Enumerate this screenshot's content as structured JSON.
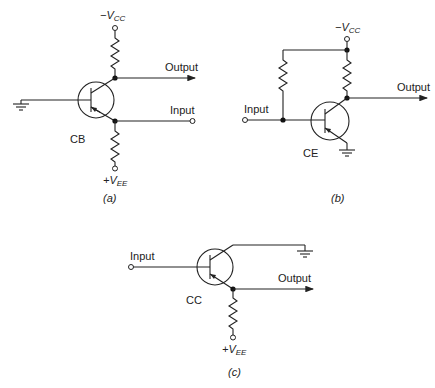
{
  "figure": {
    "panels": [
      {
        "id": "a",
        "caption": "(a)",
        "config_label": "CB",
        "top_supply": {
          "sign": "−",
          "symbol": "V",
          "subscript": "CC"
        },
        "bottom_supply": {
          "sign": "+",
          "symbol": "V",
          "subscript": "EE"
        },
        "output_label": "Output",
        "input_label": "Input"
      },
      {
        "id": "b",
        "caption": "(b)",
        "config_label": "CE",
        "top_supply": {
          "sign": "−",
          "symbol": "V",
          "subscript": "CC"
        },
        "output_label": "Output",
        "input_label": "Input"
      },
      {
        "id": "c",
        "caption": "(c)",
        "config_label": "CC",
        "bottom_supply": {
          "sign": "+",
          "symbol": "V",
          "subscript": "EE"
        },
        "output_label": "Output",
        "input_label": "Input"
      }
    ]
  }
}
